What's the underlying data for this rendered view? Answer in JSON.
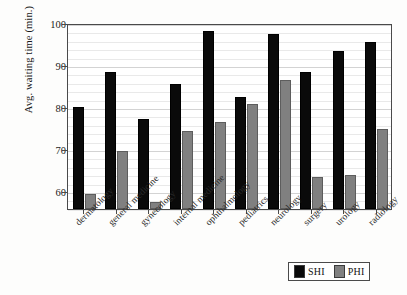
{
  "chart_data": {
    "type": "bar",
    "title": "",
    "xlabel": "",
    "ylabel": "Avg. waiting time (min.)",
    "ylim": [
      55.7,
      100
    ],
    "yticks": [
      60,
      70,
      80,
      90,
      100
    ],
    "ytick_labels": [
      "60",
      "70",
      "80",
      "90",
      "100"
    ],
    "minor_tick_step": 2,
    "grid": true,
    "legend_position": "bottom-right",
    "categories": [
      "dermatology",
      "general medicine",
      "gynecology",
      "internal medicine",
      "ophthalmology",
      "pediatrics",
      "neurology",
      "surgery",
      "urology",
      "radiology"
    ],
    "series": [
      {
        "name": "SHI",
        "color": "#0a0a0a",
        "values": [
          80.0,
          88.3,
          77.2,
          85.5,
          98.1,
          82.3,
          97.3,
          88.4,
          93.3,
          95.4
        ]
      },
      {
        "name": "PHI",
        "color": "#808080",
        "values": [
          59.2,
          69.4,
          57.3,
          74.2,
          76.4,
          80.8,
          86.5,
          63.3,
          63.7,
          74.8
        ]
      }
    ]
  },
  "axis": {
    "y_title": "Avg. waiting time (min.)"
  },
  "legend": {
    "entries": [
      {
        "label": "SHI",
        "swatch": "black-square-icon"
      },
      {
        "label": "PHI",
        "swatch": "gray-square-icon"
      }
    ]
  }
}
